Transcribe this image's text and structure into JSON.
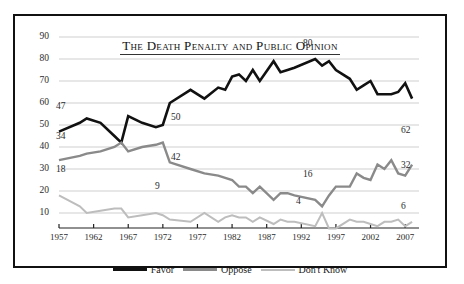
{
  "chart_data": {
    "type": "line",
    "title": "The Death Penalty and Public Opinion",
    "xlabel": "",
    "ylabel": "",
    "ylim": [
      0,
      90
    ],
    "xlim": [
      1957,
      2009
    ],
    "grid": true,
    "legend_position": "bottom-center",
    "ytick_labels": [
      "90",
      "80",
      "70",
      "60",
      "50",
      "40",
      "30",
      "20",
      "10"
    ],
    "yticks": [
      90,
      80,
      70,
      60,
      50,
      40,
      30,
      20,
      10
    ],
    "xtick_labels": [
      "1957",
      "1962",
      "1967",
      "1972",
      "1977",
      "1982",
      "1987",
      "1992",
      "1997",
      "2002",
      "2007"
    ],
    "xticks": [
      1957,
      1962,
      1967,
      1972,
      1977,
      1982,
      1987,
      1992,
      1997,
      2002,
      2007
    ],
    "series": [
      {
        "name": "Favor",
        "color": "#111111",
        "x": [
          1957,
          1960,
          1961,
          1963,
          1965,
          1966,
          1967,
          1969,
          1971,
          1972,
          1973,
          1976,
          1978,
          1980,
          1981,
          1982,
          1983,
          1984,
          1985,
          1986,
          1988,
          1989,
          1990,
          1991,
          1994,
          1995,
          1996,
          1997,
          1999,
          2000,
          2001,
          2002,
          2003,
          2004,
          2005,
          2006,
          2007,
          2008
        ],
        "values": [
          47,
          51,
          53,
          51,
          45,
          42,
          54,
          51,
          49,
          50,
          60,
          66,
          62,
          67,
          66,
          72,
          73,
          70,
          75,
          70,
          79,
          74,
          75,
          76,
          80,
          77,
          79,
          75,
          71,
          66,
          68,
          70,
          64,
          64,
          64,
          65,
          69,
          62
        ]
      },
      {
        "name": "Oppose",
        "color": "#8a8a8a",
        "x": [
          1957,
          1960,
          1961,
          1963,
          1965,
          1966,
          1967,
          1969,
          1971,
          1972,
          1973,
          1976,
          1978,
          1980,
          1981,
          1982,
          1983,
          1984,
          1985,
          1986,
          1988,
          1989,
          1990,
          1991,
          1994,
          1995,
          1996,
          1997,
          1999,
          2000,
          2001,
          2002,
          2003,
          2004,
          2005,
          2006,
          2007,
          2008
        ],
        "values": [
          34,
          36,
          37,
          38,
          40,
          42,
          38,
          40,
          41,
          42,
          33,
          30,
          28,
          27,
          26,
          25,
          22,
          22,
          19,
          22,
          16,
          19,
          19,
          18,
          16,
          13,
          18,
          22,
          22,
          28,
          26,
          25,
          32,
          30,
          34,
          28,
          27,
          32
        ]
      },
      {
        "name": "Don't Know",
        "color": "#bdbdbd",
        "x": [
          1957,
          1960,
          1961,
          1963,
          1965,
          1966,
          1967,
          1969,
          1971,
          1972,
          1973,
          1976,
          1978,
          1980,
          1981,
          1982,
          1983,
          1984,
          1985,
          1986,
          1988,
          1989,
          1990,
          1991,
          1994,
          1995,
          1996,
          1997,
          1999,
          2000,
          2001,
          2002,
          2003,
          2004,
          2005,
          2006,
          2007,
          2008
        ],
        "values": [
          18,
          13,
          10,
          11,
          12,
          12,
          8,
          9,
          10,
          9,
          7,
          6,
          10,
          6,
          8,
          9,
          8,
          8,
          6,
          8,
          5,
          7,
          6,
          6,
          4,
          10,
          3,
          3,
          7,
          6,
          6,
          5,
          4,
          6,
          6,
          7,
          4,
          6
        ]
      }
    ],
    "annotations": [
      {
        "text": "47",
        "x_px": 56,
        "y_px": 101,
        "series": "Favor"
      },
      {
        "text": "50",
        "x_px": 171,
        "y_px": 112,
        "series": "Favor"
      },
      {
        "text": "80",
        "x_px": 303,
        "y_px": 38,
        "series": "Favor"
      },
      {
        "text": "62",
        "x_px": 401,
        "y_px": 125,
        "series": "Favor"
      },
      {
        "text": "34",
        "x_px": 56,
        "y_px": 131,
        "series": "Oppose"
      },
      {
        "text": "42",
        "x_px": 171,
        "y_px": 152,
        "series": "Oppose"
      },
      {
        "text": "16",
        "x_px": 303,
        "y_px": 169,
        "series": "Oppose"
      },
      {
        "text": "32",
        "x_px": 401,
        "y_px": 160,
        "series": "Oppose"
      },
      {
        "text": "18",
        "x_px": 56,
        "y_px": 164,
        "series": "Don't Know"
      },
      {
        "text": "9",
        "x_px": 155,
        "y_px": 181,
        "series": "Don't Know"
      },
      {
        "text": "4",
        "x_px": 296,
        "y_px": 196,
        "series": "Don't Know"
      },
      {
        "text": "6",
        "x_px": 401,
        "y_px": 201,
        "series": "Don't Know"
      }
    ]
  },
  "legend": {
    "items": [
      {
        "label": "Favor",
        "color": "#111111",
        "thickness": 3
      },
      {
        "label": "Oppose",
        "color": "#8a8a8a",
        "thickness": 3
      },
      {
        "label": "Don't Know",
        "color": "#bdbdbd",
        "thickness": 2
      }
    ]
  }
}
